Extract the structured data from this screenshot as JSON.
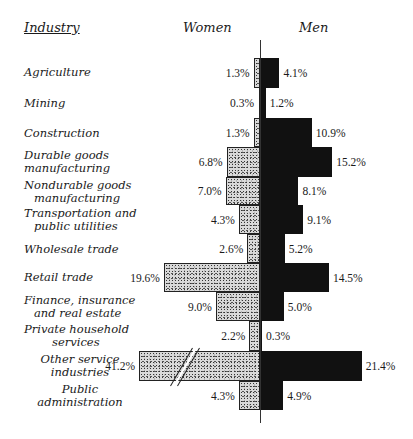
{
  "chart_data": {
    "type": "bar",
    "subtype": "back-to-back horizontal bar (population-pyramid style)",
    "title": "",
    "headers": {
      "category": "Industry",
      "left": "Women",
      "right": "Men"
    },
    "categories": [
      "Agriculture",
      "Mining",
      "Construction",
      "Durable goods manufacturing",
      "Nondurable goods manufacturing",
      "Transportation and public utilities",
      "Wholesale trade",
      "Retail trade",
      "Finance, insurance and real estate",
      "Private household services",
      "Other service industries",
      "Public administration"
    ],
    "series": [
      {
        "name": "Women",
        "pattern": "stippled",
        "values": [
          1.3,
          0.3,
          1.3,
          6.8,
          7.0,
          4.3,
          2.6,
          19.6,
          9.0,
          2.2,
          41.2,
          4.3
        ]
      },
      {
        "name": "Men",
        "pattern": "solid black",
        "values": [
          4.1,
          1.2,
          10.9,
          15.2,
          8.1,
          9.1,
          5.2,
          14.5,
          5.0,
          0.3,
          21.4,
          4.9
        ]
      }
    ],
    "units": "%",
    "annotations": [
      "Axis break on Women bar for Other service industries (41.2%)"
    ],
    "grid": false,
    "legend": "column headers (Women left, Men right)"
  },
  "labels": [
    [
      "Agriculture"
    ],
    [
      "Mining"
    ],
    [
      "Construction"
    ],
    [
      "Durable goods",
      "manufacturing"
    ],
    [
      "Nondurable goods",
      "manufacturing"
    ],
    [
      "Transportation and",
      "public utilities"
    ],
    [
      "Wholesale trade"
    ],
    [
      "Retail trade"
    ],
    [
      "Finance, insurance",
      "and real estate"
    ],
    [
      "Private household",
      "services"
    ],
    [
      "Other service",
      "industries"
    ],
    [
      "Public",
      "administration"
    ]
  ],
  "women_text": [
    "1.3%",
    "0.3%",
    "1.3%",
    "6.8%",
    "7.0%",
    "4.3%",
    "2.6%",
    "19.6%",
    "9.0%",
    "2.2%",
    "41.2%",
    "4.3%"
  ],
  "men_text": [
    "4.1%",
    "1.2%",
    "10.9%",
    "15.2%",
    "8.1%",
    "9.1%",
    "5.2%",
    "14.5%",
    "5.0%",
    "0.3%",
    "21.4%",
    "4.9%"
  ]
}
